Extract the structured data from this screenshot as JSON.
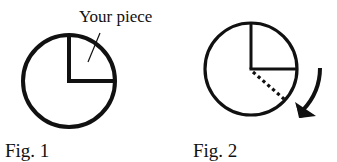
{
  "figures": [
    {
      "id": "fig1",
      "caption": "Fig. 1",
      "annotation": "Your piece",
      "description": "Circle with a quarter slice (top-right) outlined by two radii"
    },
    {
      "id": "fig2",
      "caption": "Fig. 2",
      "description": "Same circle with a dotted radius showing the slice being enlarged clockwise, with a curved clockwise arrow"
    }
  ],
  "colors": {
    "stroke": "#111111",
    "background": "#ffffff"
  }
}
